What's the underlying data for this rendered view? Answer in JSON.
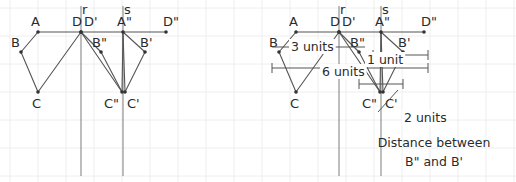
{
  "canvas": {
    "width": 516,
    "height": 182,
    "background": "#ffffff"
  },
  "style": {
    "grid_color": "#f0eef0",
    "grid_spacing": 28,
    "stroke_color": "#555555",
    "axis_color": "#888888",
    "label_color": "#2b2b2b",
    "point_color": "#333333",
    "label_font_size": 13,
    "annotation_font_size": 12.5
  },
  "panels": [
    {
      "id": "left-panel",
      "name": "reflection-construction-diagram",
      "mirror_lines": [
        {
          "name": "r",
          "label": "r",
          "x": 81,
          "y1": 6,
          "y2": 176,
          "label_x": 82,
          "label_y": 14
        },
        {
          "name": "s",
          "label": "s",
          "x": 123,
          "y1": 6,
          "y2": 176,
          "label_x": 124,
          "label_y": 14
        }
      ],
      "points": [
        {
          "id": "A",
          "label": "A",
          "x": 38,
          "y": 32,
          "label_x": 31,
          "label_y": 26
        },
        {
          "id": "B",
          "label": "B",
          "x": 21,
          "y": 52,
          "label_x": 11,
          "label_y": 47
        },
        {
          "id": "C",
          "label": "C",
          "x": 38,
          "y": 92,
          "label_x": 32,
          "label_y": 108
        },
        {
          "id": "D",
          "label": "D",
          "x": 81,
          "y": 32,
          "label_x": 72,
          "label_y": 26
        },
        {
          "id": "Dp",
          "label": "D'",
          "x": 81,
          "y": 32,
          "label_x": 84,
          "label_y": 26
        },
        {
          "id": "App",
          "label": "A\"",
          "x": 123,
          "y": 32,
          "label_x": 117,
          "label_y": 26
        },
        {
          "id": "Bpp",
          "label": "B\"",
          "x": 101,
          "y": 52,
          "label_x": 92,
          "label_y": 47
        },
        {
          "id": "Bp",
          "label": "B'",
          "x": 145,
          "y": 52,
          "label_x": 140,
          "label_y": 47
        },
        {
          "id": "Cpp",
          "label": "C\"",
          "x": 122,
          "y": 92,
          "label_x": 104,
          "label_y": 108
        },
        {
          "id": "Cp",
          "label": "C'",
          "x": 125,
          "y": 92,
          "label_x": 127,
          "label_y": 108
        },
        {
          "id": "Dpp",
          "label": "D\"",
          "x": 166,
          "y": 32,
          "label_x": 163,
          "label_y": 26
        }
      ],
      "segments": [
        {
          "from": "A",
          "to": "B"
        },
        {
          "from": "B",
          "to": "C"
        },
        {
          "from": "C",
          "to": "D"
        },
        {
          "from": "A",
          "to": "Dpp"
        },
        {
          "from": "Dp",
          "to": "Bpp"
        },
        {
          "from": "Bpp",
          "to": "Cpp"
        },
        {
          "from": "Cpp",
          "to": "Dp"
        },
        {
          "from": "App",
          "to": "Bp"
        },
        {
          "from": "Bp",
          "to": "Cp"
        },
        {
          "from": "Cp",
          "to": "App"
        },
        {
          "from": "App",
          "to": "Cpp"
        }
      ]
    },
    {
      "id": "right-panel",
      "name": "annotated-reflection-diagram",
      "offset_x": 258,
      "annotations": [
        {
          "id": "three-units",
          "text": "3 units",
          "text_x": 291,
          "text_y": 51,
          "measure_line": {
            "x1": 272,
            "y1": 47,
            "x2": 365,
            "y2": 47
          }
        },
        {
          "id": "six-units",
          "text": "6 units",
          "text_x": 322,
          "text_y": 76,
          "measure_line": {
            "x1": 272,
            "y1": 68,
            "x2": 428,
            "y2": 68
          },
          "ticks": [
            {
              "x": 272,
              "y1": 63,
              "y2": 73
            },
            {
              "x": 428,
              "y1": 63,
              "y2": 73
            }
          ]
        },
        {
          "id": "one-unit",
          "text": "1 unit",
          "text_x": 367,
          "text_y": 64,
          "measure_line": {
            "x1": 373,
            "y1": 55,
            "x2": 428,
            "y2": 55
          },
          "ticks": [
            {
              "x": 373,
              "y1": 50,
              "y2": 60
            },
            {
              "x": 428,
              "y1": 50,
              "y2": 60
            }
          ]
        },
        {
          "id": "two-units",
          "text": "2 units",
          "text_x": 404,
          "text_y": 122,
          "measure_line": {
            "x1": 359,
            "y1": 84,
            "x2": 403,
            "y2": 84
          },
          "ticks": [
            {
              "x": 359,
              "y1": 79,
              "y2": 89
            },
            {
              "x": 403,
              "y1": 79,
              "y2": 89
            }
          ],
          "leader": {
            "x1": 398,
            "y1": 90,
            "x2": 378,
            "y2": 112
          }
        }
      ],
      "caption": {
        "line1": "Distance between",
        "line2": "B\" and B'",
        "line1_x": 434,
        "line1_y": 147,
        "line2_x": 434,
        "line2_y": 166
      }
    }
  ]
}
